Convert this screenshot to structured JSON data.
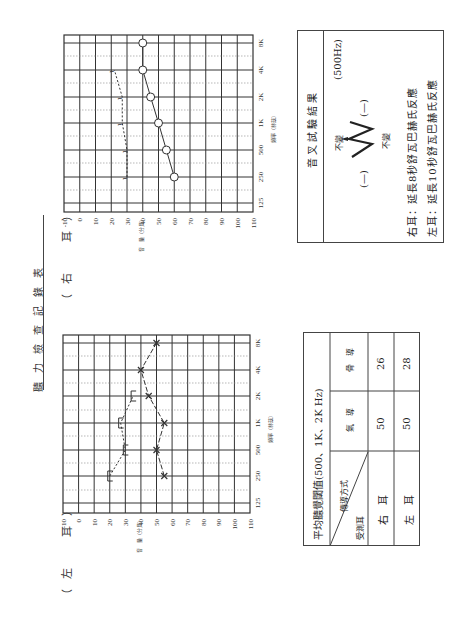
{
  "document": {
    "title": "聽力檢查記錄表",
    "orientation": "rotated-90-ccw"
  },
  "charts": {
    "right_ear_label": "（右　耳）",
    "left_ear_label": "（左　耳）",
    "intensity_axis_label": "音　量（分貝）",
    "frequency_axis_label": "頻率（赫茲）",
    "db_ticks": [
      "-10",
      "0",
      "10",
      "20",
      "30",
      "40",
      "50",
      "60",
      "70",
      "80",
      "90",
      "100",
      "110"
    ],
    "freq_ticks": [
      "125",
      "250",
      "500",
      "1K",
      "2K",
      "4K",
      "8K"
    ]
  },
  "tuning_fork": {
    "title": "音叉試驗結果",
    "frequency": "(500Hz)",
    "left_result": "(—)",
    "right_result": "(—)",
    "weber_symbol": "W",
    "weber_left_note": "不變",
    "weber_right_note": "不變",
    "right_ear_result": "右耳：延長8秒舒瓦巴赫氏反應",
    "left_ear_result": "左耳：延長10秒舒瓦巴赫氏反應"
  },
  "pta_table": {
    "title": "平均聽覺閾值(500、1K、2K Hz)",
    "corner_top": "傳導方式",
    "corner_bottom": "受測耳",
    "columns": [
      "氣　導",
      "骨　導"
    ],
    "rows": [
      {
        "ear": "右　耳",
        "air": "50",
        "bone": "26"
      },
      {
        "ear": "左　耳",
        "air": "50",
        "bone": "28"
      }
    ]
  },
  "chart_data": [
    {
      "type": "line",
      "title": "右耳",
      "xlabel": "頻率（赫茲）",
      "ylabel": "音量（分貝）",
      "x": [
        "250",
        "500",
        "1K",
        "2K",
        "4K",
        "8K"
      ],
      "ylim": [
        -10,
        110
      ],
      "y_inverted": true,
      "grid": true,
      "series": [
        {
          "name": "氣導 (O)",
          "marker": "circle",
          "values": [
            60,
            55,
            50,
            45,
            40,
            40
          ]
        },
        {
          "name": "骨導 (>)",
          "marker": "bracket",
          "values": [
            30,
            30,
            27,
            27,
            22,
            null
          ]
        }
      ]
    },
    {
      "type": "line",
      "title": "左耳",
      "xlabel": "頻率（赫茲）",
      "ylabel": "音量（分貝）",
      "x": [
        "250",
        "500",
        "1K",
        "2K",
        "4K",
        "8K"
      ],
      "ylim": [
        -10,
        110
      ],
      "y_inverted": true,
      "grid": true,
      "series": [
        {
          "name": "氣導 (X)",
          "marker": "x",
          "values": [
            55,
            50,
            55,
            45,
            40,
            50
          ]
        },
        {
          "name": "骨導 ([)",
          "marker": "bracket",
          "values": [
            20,
            30,
            27,
            35,
            null,
            null
          ]
        }
      ]
    }
  ]
}
